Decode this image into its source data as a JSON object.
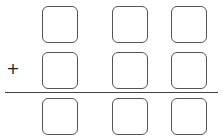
{
  "problem": {
    "type": "column-addition",
    "operator": "+",
    "rows": [
      {
        "name": "addend-1",
        "digits": [
          "",
          "",
          ""
        ]
      },
      {
        "name": "addend-2",
        "digits": [
          "",
          "",
          ""
        ]
      },
      {
        "name": "sum",
        "digits": [
          "",
          "",
          ""
        ]
      }
    ],
    "layout": {
      "columns_x": [
        42,
        112,
        171
      ],
      "rows_y": [
        6,
        52,
        98
      ],
      "line_y": 92
    }
  }
}
